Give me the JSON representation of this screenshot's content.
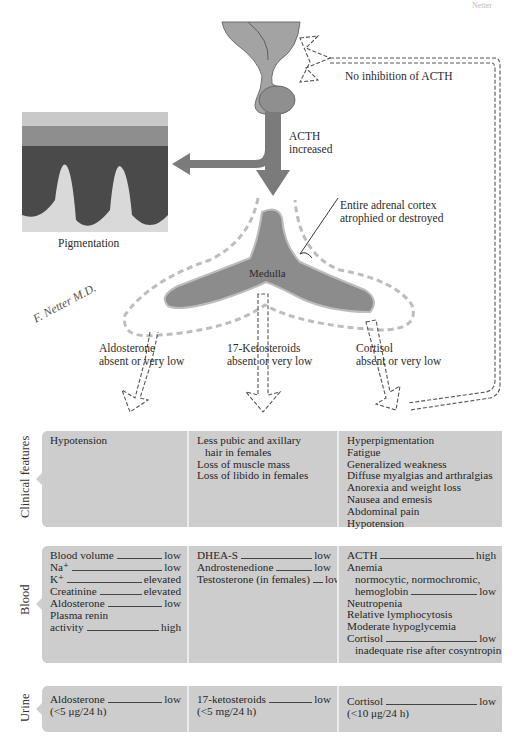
{
  "page_marker": "Netter",
  "diagram": {
    "feedback_label": "No inhibition of ACTH",
    "acth_label": [
      "ACTH",
      "increased"
    ],
    "skin_caption": "Pigmentation",
    "cortex_label": [
      "Entire adrenal cortex",
      "atrophied or destroyed"
    ],
    "medulla_label": "Medulla",
    "signature": "F. Netter M.D.",
    "outputs": [
      {
        "name": "Aldosterone",
        "status": "absent or very low"
      },
      {
        "name": "17-Ketosteroids",
        "status": "absent or very low"
      },
      {
        "name": "Cortisol",
        "status": "absent or very low"
      }
    ],
    "colors": {
      "arrow": "#7d7d7d",
      "gland": "#8a8a8a",
      "panel": "#cdcdcd",
      "dashed": "#bdbdbd"
    }
  },
  "table": {
    "rows": [
      {
        "label": "Clinical features",
        "cells": [
          {
            "lines": [
              "Hypotension"
            ]
          },
          {
            "lines": [
              "Less pubic and axillary",
              "  hair in females",
              "Loss of muscle mass",
              "Loss of libido in females"
            ]
          },
          {
            "lines": [
              "Hyperpigmentation",
              "Fatigue",
              "Generalized weakness",
              "Diffuse myalgias and arthralgias",
              "Anorexia and weight loss",
              "Nausea and emesis",
              "Abdominal pain",
              "Hypotension"
            ]
          }
        ]
      },
      {
        "label": "Blood",
        "cells": [
          {
            "items": [
              {
                "k": "Blood volume",
                "v": "low"
              },
              {
                "k": "Na⁺",
                "v": "low"
              },
              {
                "k": "K⁺",
                "v": "elevated"
              },
              {
                "k": "Creatinine",
                "v": "elevated"
              },
              {
                "k": "Aldosterone",
                "v": "low"
              },
              {
                "k": "Plasma renin",
                "v": ""
              },
              {
                "k": "activity",
                "v": "high"
              }
            ]
          },
          {
            "items": [
              {
                "k": "DHEA-S",
                "v": "low"
              },
              {
                "k": "Androstenedione",
                "v": "low"
              },
              {
                "k": "Testosterone (in females)",
                "v": "low"
              }
            ]
          },
          {
            "items": [
              {
                "k": "ACTH",
                "v": "high"
              },
              {
                "k": "Anemia",
                "v": ""
              },
              {
                "k": "  normocytic, normochromic,",
                "v": ""
              },
              {
                "k": "  hemoglobin",
                "v": "low"
              },
              {
                "k": "Neutropenia",
                "v": ""
              },
              {
                "k": "Relative lymphocytosis",
                "v": ""
              },
              {
                "k": "Moderate hypoglycemia",
                "v": ""
              },
              {
                "k": "Cortisol",
                "v": "low"
              },
              {
                "k": "  inadequate rise after cosyntropin",
                "v": ""
              }
            ]
          }
        ]
      },
      {
        "label": "Urine",
        "cells": [
          {
            "items": [
              {
                "k": "Aldosterone",
                "v": "low"
              },
              {
                "k": "(<5 μg/24 h)",
                "v": ""
              }
            ]
          },
          {
            "items": [
              {
                "k": "17-ketosteroids",
                "v": "low"
              },
              {
                "k": "(<5 mg/24 h)",
                "v": ""
              }
            ]
          },
          {
            "items": [
              {
                "k": "Cortisol",
                "v": "low"
              },
              {
                "k": "(<10 μg/24 h)",
                "v": ""
              }
            ]
          }
        ]
      }
    ]
  }
}
